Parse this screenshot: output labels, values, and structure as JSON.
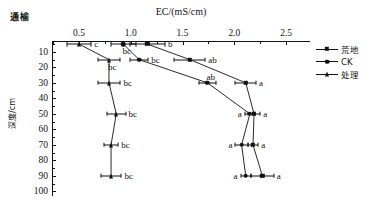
{
  "corner_label": "通榆",
  "axes": {
    "x_title": "EC/(mS/cm)",
    "y_title": "深度/cm",
    "x_ticks": [
      "0.5",
      "1.0",
      "1.5",
      "2.0",
      "2.5"
    ],
    "y_ticks": [
      "10",
      "20",
      "30",
      "40",
      "50",
      "60",
      "70",
      "80",
      "90",
      "100"
    ]
  },
  "legend": {
    "items": [
      {
        "label": "荒地",
        "marker": "square"
      },
      {
        "label": "CK",
        "marker": "circle"
      },
      {
        "label": "处理",
        "marker": "triangle"
      }
    ]
  },
  "chart_data": {
    "type": "line",
    "title": "",
    "xlabel": "EC/(mS/cm)",
    "ylabel": "深度/cm",
    "xlim": [
      0.24,
      2.73
    ],
    "ylim": [
      3,
      103
    ],
    "y_inverted": true,
    "grid": false,
    "legend_position": "right",
    "x_ticks": [
      0.5,
      1.0,
      1.5,
      2.0,
      2.5
    ],
    "y_ticks": [
      10,
      20,
      30,
      40,
      50,
      60,
      70,
      80,
      90,
      100
    ],
    "depths": [
      5,
      15,
      30,
      50,
      70,
      90
    ],
    "series": [
      {
        "name": "荒地",
        "marker": "square",
        "x": [
          1.16,
          1.57,
          2.11,
          2.19,
          2.18,
          2.27
        ],
        "xerr": [
          0.17,
          0.15,
          0.1,
          0.06,
          0.05,
          0.11
        ],
        "labels": [
          "b",
          "ab",
          "a",
          "a",
          "a",
          "a"
        ],
        "label_side": [
          "right",
          "right",
          "right",
          "right",
          "right",
          "right"
        ]
      },
      {
        "name": "CK",
        "marker": "circle",
        "x": [
          0.93,
          1.08,
          1.74,
          2.15,
          2.07,
          2.11
        ],
        "xerr": [
          0.12,
          0.09,
          0.08,
          0.05,
          0.06,
          0.05
        ],
        "labels": [
          "bc",
          "bc",
          "ab",
          "a",
          "a",
          "a"
        ],
        "label_side": [
          "below",
          "right",
          "above",
          "left",
          "left",
          "left"
        ]
      },
      {
        "name": "处理",
        "marker": "triangle",
        "x": [
          0.5,
          0.79,
          0.79,
          0.86,
          0.81,
          0.81
        ],
        "xerr": [
          0.12,
          0.11,
          0.11,
          0.09,
          0.07,
          0.1
        ],
        "labels": [
          "c",
          "bc",
          "bc",
          "bc",
          "bc",
          "bc"
        ],
        "label_side": [
          "right",
          "below",
          "right",
          "right",
          "right",
          "right"
        ]
      }
    ]
  }
}
